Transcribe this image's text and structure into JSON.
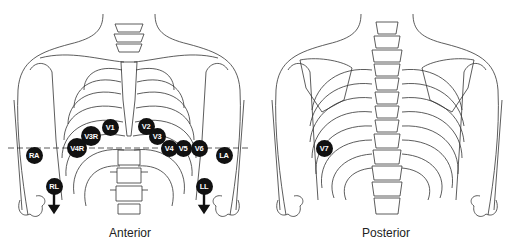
{
  "views": [
    {
      "name": "anterior",
      "caption": "Anterior"
    },
    {
      "name": "posterior",
      "caption": "Posterior"
    }
  ],
  "electrodes": {
    "anterior": [
      {
        "label": "V1",
        "x": 110,
        "y": 127
      },
      {
        "label": "V2",
        "x": 146,
        "y": 126
      },
      {
        "label": "V3R",
        "x": 91,
        "y": 136
      },
      {
        "label": "V3",
        "x": 157,
        "y": 136
      },
      {
        "label": "V4R",
        "x": 77,
        "y": 148
      },
      {
        "label": "V4",
        "x": 169,
        "y": 148
      },
      {
        "label": "V5",
        "x": 183,
        "y": 148
      },
      {
        "label": "V6",
        "x": 199,
        "y": 148
      },
      {
        "label": "RA",
        "x": 34,
        "y": 155
      },
      {
        "label": "LA",
        "x": 224,
        "y": 155
      },
      {
        "label": "RL",
        "x": 54,
        "y": 186
      },
      {
        "label": "LL",
        "x": 204,
        "y": 186
      }
    ],
    "posterior": [
      {
        "label": "V7",
        "x": 324,
        "y": 148
      }
    ]
  },
  "colors": {
    "line": "#333333",
    "electrode": "#111111",
    "electrode_text": "#ffffff"
  }
}
